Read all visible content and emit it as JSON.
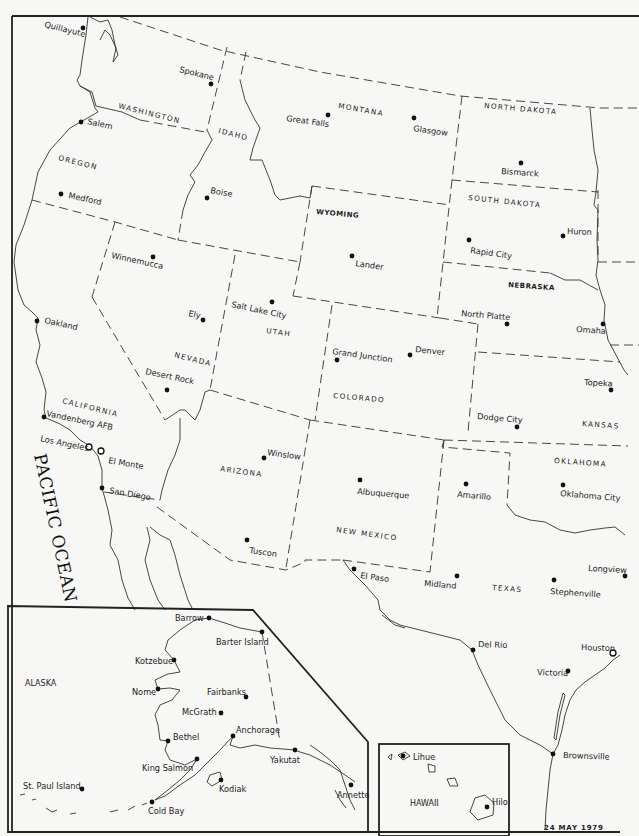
{
  "map": {
    "date": "24 MAY 1979",
    "ocean_label": "PACIFIC OCEAN",
    "states": [
      {
        "name": "WASHINGTON",
        "x": 118,
        "y": 108,
        "rot": 14
      },
      {
        "name": "OREGON",
        "x": 58,
        "y": 160,
        "rot": 14
      },
      {
        "name": "IDAHO",
        "x": 218,
        "y": 133,
        "rot": 14
      },
      {
        "name": "MONTANA",
        "x": 338,
        "y": 108,
        "rot": 10
      },
      {
        "name": "NORTH DAKOTA",
        "x": 484,
        "y": 108,
        "rot": 5
      },
      {
        "name": "SOUTH DAKOTA",
        "x": 468,
        "y": 200,
        "rot": 6
      },
      {
        "name": "WYOMING",
        "x": 316,
        "y": 214,
        "rot": 5
      },
      {
        "name": "NEBRASKA",
        "x": 508,
        "y": 287,
        "rot": 4
      },
      {
        "name": "UTAH",
        "x": 266,
        "y": 333,
        "rot": 8
      },
      {
        "name": "NEVADA",
        "x": 174,
        "y": 357,
        "rot": 14
      },
      {
        "name": "CALIFORNIA",
        "x": 62,
        "y": 403,
        "rot": 14
      },
      {
        "name": "COLORADO",
        "x": 333,
        "y": 398,
        "rot": 5
      },
      {
        "name": "KANSAS",
        "x": 582,
        "y": 426,
        "rot": 4
      },
      {
        "name": "ARIZONA",
        "x": 220,
        "y": 471,
        "rot": 8
      },
      {
        "name": "OKLAHOMA",
        "x": 554,
        "y": 463,
        "rot": 4
      },
      {
        "name": "NEW MEXICO",
        "x": 336,
        "y": 532,
        "rot": 8
      },
      {
        "name": "TEXAS",
        "x": 492,
        "y": 590,
        "rot": 4
      }
    ],
    "stations": [
      {
        "name": "Quillayute",
        "x": 83,
        "y": 28,
        "lx": 44,
        "ly": 27,
        "rot": 14,
        "marker": "dot"
      },
      {
        "name": "Spokane",
        "x": 211,
        "y": 84,
        "lx": 179,
        "ly": 72,
        "rot": 14,
        "marker": "dot"
      },
      {
        "name": "Salem",
        "x": 81,
        "y": 122,
        "lx": 87,
        "ly": 124,
        "rot": 12,
        "marker": "dot"
      },
      {
        "name": "Medford",
        "x": 61,
        "y": 194,
        "lx": 68,
        "ly": 198,
        "rot": 12,
        "marker": "dot"
      },
      {
        "name": "Boise",
        "x": 207,
        "y": 198,
        "lx": 210,
        "ly": 193,
        "rot": 10,
        "marker": "dot"
      },
      {
        "name": "Great Falls",
        "x": 328,
        "y": 115,
        "lx": 286,
        "ly": 121,
        "rot": 8,
        "marker": "dot"
      },
      {
        "name": "Glasgow",
        "x": 414,
        "y": 118,
        "lx": 413,
        "ly": 131,
        "rot": 8,
        "marker": "dot"
      },
      {
        "name": "Bismarck",
        "x": 521,
        "y": 163,
        "lx": 501,
        "ly": 174,
        "rot": 4,
        "marker": "dot"
      },
      {
        "name": "Winnemucca",
        "x": 153,
        "y": 257,
        "lx": 111,
        "ly": 258,
        "rot": 12,
        "marker": "dot"
      },
      {
        "name": "Lander",
        "x": 352,
        "y": 256,
        "lx": 355,
        "ly": 266,
        "rot": 8,
        "marker": "dot"
      },
      {
        "name": "Rapid City",
        "x": 469,
        "y": 240,
        "lx": 470,
        "ly": 253,
        "rot": 8,
        "marker": "dot"
      },
      {
        "name": "Huron",
        "x": 563,
        "y": 236,
        "lx": 567,
        "ly": 234,
        "rot": 2,
        "marker": "dot"
      },
      {
        "name": "Oakland",
        "x": 37,
        "y": 321,
        "lx": 44,
        "ly": 323,
        "rot": 12,
        "marker": "dot"
      },
      {
        "name": "Salt Lake City",
        "x": 272,
        "y": 302,
        "lx": 231,
        "ly": 307,
        "rot": 12,
        "marker": "dot"
      },
      {
        "name": "Ely",
        "x": 203,
        "y": 320,
        "lx": 188,
        "ly": 316,
        "rot": 12,
        "marker": "dot"
      },
      {
        "name": "North Platte",
        "x": 507,
        "y": 324,
        "lx": 461,
        "ly": 316,
        "rot": 5,
        "marker": "dot"
      },
      {
        "name": "Omaha",
        "x": 603,
        "y": 324,
        "lx": 576,
        "ly": 332,
        "rot": 4,
        "marker": "dot"
      },
      {
        "name": "Grand Junction",
        "x": 337,
        "y": 360,
        "lx": 332,
        "ly": 354,
        "rot": 8,
        "marker": "dot"
      },
      {
        "name": "Denver",
        "x": 410,
        "y": 355,
        "lx": 415,
        "ly": 352,
        "rot": 6,
        "marker": "dot"
      },
      {
        "name": "Desert Rock",
        "x": 167,
        "y": 390,
        "lx": 145,
        "ly": 374,
        "rot": 12,
        "marker": "dot"
      },
      {
        "name": "Topeka",
        "x": 611,
        "y": 390,
        "lx": 584,
        "ly": 385,
        "rot": 3,
        "marker": "dot"
      },
      {
        "name": "Vandenberg AFB",
        "x": 44,
        "y": 417,
        "lx": 46,
        "ly": 416,
        "rot": 12,
        "marker": "dot"
      },
      {
        "name": "Dodge City",
        "x": 517,
        "y": 427,
        "lx": 477,
        "ly": 419,
        "rot": 5,
        "marker": "dot"
      },
      {
        "name": "Los Angeles",
        "x": 89,
        "y": 447,
        "lx": 40,
        "ly": 441,
        "rot": 12,
        "marker": "ring"
      },
      {
        "name": "El Monte",
        "x": 101,
        "y": 451,
        "lx": 108,
        "ly": 463,
        "rot": 10,
        "marker": "ring"
      },
      {
        "name": "Winslow",
        "x": 264,
        "y": 458,
        "lx": 267,
        "ly": 455,
        "rot": 8,
        "marker": "dot"
      },
      {
        "name": "Albuquerque",
        "x": 360,
        "y": 480,
        "lx": 357,
        "ly": 494,
        "rot": 5,
        "marker": "dot"
      },
      {
        "name": "Amarillo",
        "x": 466,
        "y": 484,
        "lx": 457,
        "ly": 497,
        "rot": 5,
        "marker": "dot"
      },
      {
        "name": "Oklahoma City",
        "x": 563,
        "y": 485,
        "lx": 560,
        "ly": 496,
        "rot": 5,
        "marker": "dot"
      },
      {
        "name": "San Diego",
        "x": 102,
        "y": 488,
        "lx": 109,
        "ly": 493,
        "rot": 10,
        "marker": "dot"
      },
      {
        "name": "Tuscon",
        "x": 247,
        "y": 540,
        "lx": 249,
        "ly": 553,
        "rot": 8,
        "marker": "dot"
      },
      {
        "name": "El Paso",
        "x": 354,
        "y": 569,
        "lx": 360,
        "ly": 578,
        "rot": 8,
        "marker": "dot"
      },
      {
        "name": "Midland",
        "x": 457,
        "y": 576,
        "lx": 424,
        "ly": 586,
        "rot": 5,
        "marker": "dot"
      },
      {
        "name": "Stephenville",
        "x": 554,
        "y": 580,
        "lx": 550,
        "ly": 594,
        "rot": 4,
        "marker": "dot"
      },
      {
        "name": "Longview",
        "x": 625,
        "y": 576,
        "lx": 588,
        "ly": 571,
        "rot": 3,
        "marker": "dot"
      },
      {
        "name": "Del Rio",
        "x": 473,
        "y": 650,
        "lx": 478,
        "ly": 647,
        "rot": 2,
        "marker": "dot"
      },
      {
        "name": "Houston",
        "x": 613,
        "y": 653,
        "lx": 581,
        "ly": 650,
        "rot": 2,
        "marker": "ring"
      },
      {
        "name": "Victoria",
        "x": 568,
        "y": 671,
        "lx": 537,
        "ly": 675,
        "rot": 2,
        "marker": "dot"
      },
      {
        "name": "Brownsville",
        "x": 553,
        "y": 754,
        "lx": 563,
        "ly": 758,
        "rot": 2,
        "marker": "dot"
      }
    ],
    "alaska": {
      "label": "ALASKA",
      "stations": [
        {
          "name": "Barrow",
          "x": 209,
          "y": 618,
          "lx": 175,
          "ly": 621
        },
        {
          "name": "Barter Island",
          "x": 262,
          "y": 632,
          "lx": 216,
          "ly": 645
        },
        {
          "name": "Kotzebue",
          "x": 174,
          "y": 660,
          "lx": 135,
          "ly": 664
        },
        {
          "name": "Nome",
          "x": 158,
          "y": 689,
          "lx": 132,
          "ly": 695
        },
        {
          "name": "Fairbanks",
          "x": 246,
          "y": 697,
          "lx": 207,
          "ly": 695
        },
        {
          "name": "McGrath",
          "x": 221,
          "y": 713,
          "lx": 182,
          "ly": 715
        },
        {
          "name": "Anchorage",
          "x": 233,
          "y": 736,
          "lx": 236,
          "ly": 733
        },
        {
          "name": "Bethel",
          "x": 168,
          "y": 741,
          "lx": 173,
          "ly": 740
        },
        {
          "name": "King Salmon",
          "x": 197,
          "y": 759,
          "lx": 142,
          "ly": 771
        },
        {
          "name": "Yakutat",
          "x": 295,
          "y": 750,
          "lx": 270,
          "ly": 763
        },
        {
          "name": "St. Paul Island",
          "x": 82,
          "y": 789,
          "lx": 23,
          "ly": 789
        },
        {
          "name": "Kodiak",
          "x": 221,
          "y": 780,
          "lx": 219,
          "ly": 792
        },
        {
          "name": "Annette",
          "x": 351,
          "y": 785,
          "lx": 337,
          "ly": 798
        },
        {
          "name": "Cold Bay",
          "x": 152,
          "y": 802,
          "lx": 148,
          "ly": 814
        }
      ]
    },
    "hawaii": {
      "label": "HAWAII",
      "stations": [
        {
          "name": "Lihue",
          "x": 403,
          "y": 756,
          "lx": 413,
          "ly": 760
        },
        {
          "name": "Hilo",
          "x": 487,
          "y": 807,
          "lx": 492,
          "ly": 805
        }
      ]
    }
  }
}
